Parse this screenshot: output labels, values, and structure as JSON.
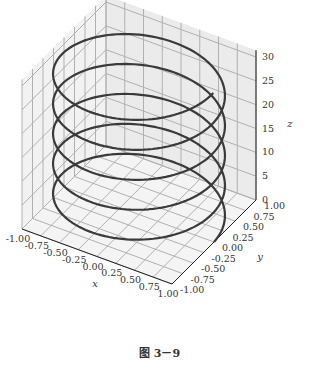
{
  "title": "螺旋线",
  "caption": "图 3－9",
  "chart_data": {
    "type": "line",
    "projection": "3d",
    "title": "螺旋线",
    "xlabel": "x",
    "ylabel": "y",
    "zlabel": "z",
    "x_ticks": [
      "-1.00",
      "-0.75",
      "-0.50",
      "-0.25",
      "0.00",
      "0.25",
      "0.50",
      "0.75",
      "1.00"
    ],
    "y_ticks": [
      "-1.00",
      "-0.75",
      "-0.50",
      "-0.25",
      "0.00",
      "0.25",
      "0.50",
      "0.75",
      "1.00"
    ],
    "z_ticks": [
      "0",
      "5",
      "10",
      "15",
      "20",
      "25",
      "30"
    ],
    "xlim": [
      -1,
      1
    ],
    "ylim": [
      -1,
      1
    ],
    "zlim": [
      0,
      31.4
    ],
    "grid": true,
    "series": [
      {
        "name": "helix",
        "parametric": "x = cos(t), y = sin(t), z = t",
        "t_range": [
          0,
          31.4
        ],
        "turns": 5,
        "color": "#3a3a3a"
      }
    ],
    "legend": null
  },
  "colors": {
    "curve": "#3a3a3a",
    "pane": "#f0f0f0",
    "grid": "#b0b0b0"
  }
}
